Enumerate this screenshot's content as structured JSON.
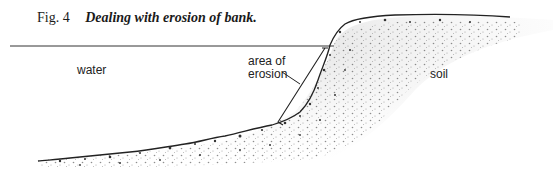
{
  "figure": {
    "number": "Fig. 4",
    "title": "Dealing with erosion of bank."
  },
  "labels": {
    "water": "water",
    "erosion_line1": "area of",
    "erosion_line2": "erosion",
    "soil": "soil"
  },
  "colors": {
    "ink": "#1a1a1a",
    "stipple": "#555555",
    "background": "#ffffff"
  }
}
